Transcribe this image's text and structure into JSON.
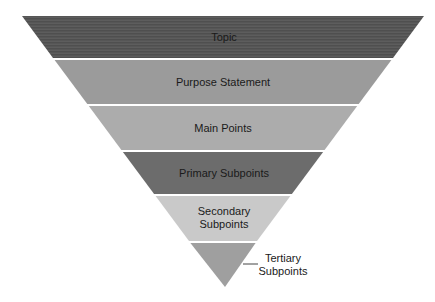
{
  "diagram": {
    "type": "inverted-pyramid",
    "levels": [
      {
        "label": "Topic",
        "lines": [
          "Topic"
        ],
        "color": "#565656"
      },
      {
        "label": "Purpose Statement",
        "lines": [
          "Purpose Statement"
        ],
        "color": "#9b9b9b"
      },
      {
        "label": "Main Points",
        "lines": [
          "Main Points"
        ],
        "color": "#acacac"
      },
      {
        "label": "Primary Subpoints",
        "lines": [
          "Primary Subpoints"
        ],
        "color": "#6c6c6c"
      },
      {
        "label": "Secondary Subpoints",
        "lines": [
          "Secondary",
          "Subpoints"
        ],
        "color": "#c9c9c9"
      },
      {
        "label": "Tertiary Subpoints",
        "lines": [
          "Tertiary",
          "Subpoints"
        ],
        "color": "#9f9f9f",
        "callout": true
      }
    ]
  }
}
